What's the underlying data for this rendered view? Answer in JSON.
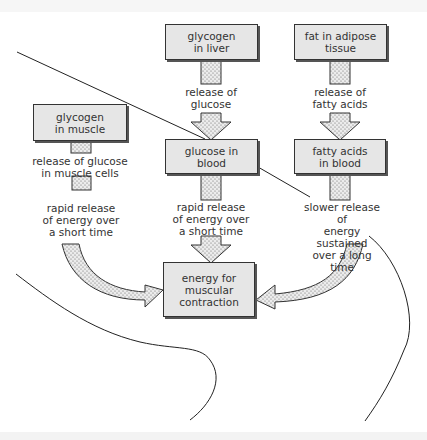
{
  "diagram": {
    "title": "",
    "boxes": {
      "glycogen_liver": "glycogen\nin liver",
      "fat_adipose": "fat in adipose\ntissue",
      "glycogen_muscle": "glycogen\nin muscle",
      "glucose_blood": "glucose in\nblood",
      "fatty_acids_blood": "fatty acids\nin blood",
      "energy": "energy for\nmuscular\ncontraction"
    },
    "labels": {
      "release_glucose": "release of\nglucose",
      "release_fatty_acids": "release of\nfatty acids",
      "release_glucose_muscle": "release of glucose\nin muscle cells",
      "rapid_muscle": "rapid release\nof energy over\na short time",
      "rapid_blood": "rapid release\nof energy over\na short time",
      "slower_fat": "slower release of\nenergy sustained\nover a long time"
    },
    "colors": {
      "box_fill": "#e6e6e6",
      "outline": "#333333",
      "arrow_fill": "#dcdcdc"
    }
  }
}
